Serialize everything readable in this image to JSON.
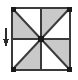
{
  "figure": {
    "title": "Square subdivided into eight triangles with load arrow",
    "canvas": {
      "width": 78,
      "height": 80
    },
    "colors": {
      "fill_shaded": "#c9c9c9",
      "fill_empty": "#ffffff",
      "stroke": "#3a3a3a",
      "node": "#1a1a1a",
      "arrow": "#2b2b2b"
    },
    "square": {
      "name": "mesh-square",
      "x": 12,
      "y": 8,
      "width": 58,
      "height": 62,
      "stroke_width": 2
    },
    "lines": [
      {
        "name": "midline-horizontal",
        "x1": 12,
        "y1": 39,
        "x2": 70,
        "y2": 39
      },
      {
        "name": "midline-vertical",
        "x1": 41,
        "y1": 8,
        "x2": 41,
        "y2": 70
      },
      {
        "name": "diagonal-main",
        "x1": 12,
        "y1": 8,
        "x2": 70,
        "y2": 70
      },
      {
        "name": "diagonal-anti",
        "x1": 70,
        "y1": 8,
        "x2": 12,
        "y2": 70
      }
    ],
    "triangles": [
      {
        "name": "triangle-top-left-upper",
        "points": "12,8 41,8 41,39",
        "shaded": false
      },
      {
        "name": "triangle-top-left-lower",
        "points": "12,8 41,39 12,39",
        "shaded": true
      },
      {
        "name": "triangle-top-right-upper",
        "points": "41,8 70,8 41,39",
        "shaded": true
      },
      {
        "name": "triangle-top-right-lower",
        "points": "70,8 70,39 41,39",
        "shaded": false
      },
      {
        "name": "triangle-bottom-left-upper",
        "points": "12,39 41,39 12,70",
        "shaded": false
      },
      {
        "name": "triangle-bottom-left-lower",
        "points": "41,39 41,70 12,70",
        "shaded": true
      },
      {
        "name": "triangle-bottom-right-upper",
        "points": "41,39 70,39 70,70",
        "shaded": true
      },
      {
        "name": "triangle-bottom-right-lower",
        "points": "41,39 70,70 41,70",
        "shaded": false
      }
    ],
    "nodes": [
      {
        "name": "node-corner-top-left",
        "cx": 13,
        "cy": 9,
        "size": 5
      },
      {
        "name": "node-corner-top-right",
        "cx": 69,
        "cy": 9,
        "size": 5
      },
      {
        "name": "node-corner-bottom-left",
        "cx": 13,
        "cy": 69,
        "size": 5
      },
      {
        "name": "node-corner-bottom-right",
        "cx": 69,
        "cy": 69,
        "size": 5
      },
      {
        "name": "node-center",
        "cx": 41,
        "cy": 39,
        "size": 6
      }
    ],
    "arrow": {
      "name": "load-arrow-down",
      "x": 6,
      "y_start": 28,
      "y_end": 46,
      "head_width": 6,
      "head_length": 6,
      "direction": "down",
      "label": ""
    }
  }
}
